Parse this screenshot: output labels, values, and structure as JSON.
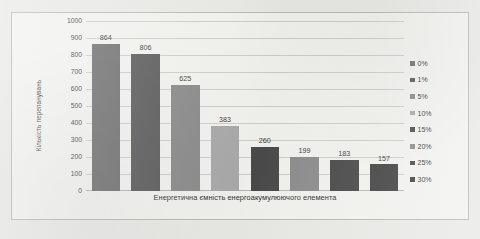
{
  "chart_data": {
    "type": "bar",
    "title": "",
    "xlabel": "Енергетична ємність енергоакумулюючого елемента",
    "ylabel": "Кількість перепанувань",
    "categories": [
      "0%",
      "1%",
      "5%",
      "10%",
      "15%",
      "20%",
      "25%",
      "30%"
    ],
    "values": [
      864,
      806,
      625,
      383,
      260,
      199,
      183,
      157
    ],
    "value_labels": [
      "864",
      "806",
      "625",
      "383",
      "260",
      "199",
      "183",
      "157"
    ],
    "bar_colors": [
      "#6e6e6e",
      "#585858",
      "#888888",
      "#a8a8a8",
      "#4a4a4a",
      "#8c8c8c",
      "#464646",
      "#3f3f3f"
    ],
    "ylim": [
      0,
      1000
    ],
    "ytick_labels": [
      "1000",
      "900",
      "800",
      "700",
      "600",
      "500",
      "400",
      "300",
      "200",
      "100",
      "0"
    ],
    "ytick_values": [
      1000,
      900,
      800,
      700,
      600,
      500,
      400,
      300,
      200,
      100,
      0
    ],
    "grid": true,
    "legend_position": "right",
    "legend": [
      {
        "label": "0%",
        "color": "#6e6e6e"
      },
      {
        "label": "1%",
        "color": "#585858"
      },
      {
        "label": "5%",
        "color": "#888888"
      },
      {
        "label": "10%",
        "color": "#a8a8a8"
      },
      {
        "label": "15%",
        "color": "#4a4a4a"
      },
      {
        "label": "20%",
        "color": "#8c8c8c"
      },
      {
        "label": "25%",
        "color": "#464646"
      },
      {
        "label": "30%",
        "color": "#3f3f3f"
      }
    ]
  },
  "colors": {
    "page_background": "#e9e9e6",
    "chart_background": "#f2f2ef",
    "frame_border": "#b8b8b4",
    "gridline": "#cdcdc9",
    "text": "#3b3b3b"
  }
}
